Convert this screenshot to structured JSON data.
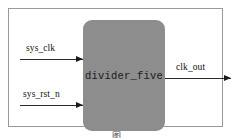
{
  "figure": {
    "module": {
      "name": "divider_five",
      "fill_color": "#8d8d8d"
    },
    "inputs": [
      {
        "name": "sys_clk"
      },
      {
        "name": "sys_rst_n"
      }
    ],
    "outputs": [
      {
        "name": "clk_out"
      }
    ],
    "caption": "图",
    "frame_color": "#9a9a9a",
    "wire_color": "#2a2a2a"
  }
}
